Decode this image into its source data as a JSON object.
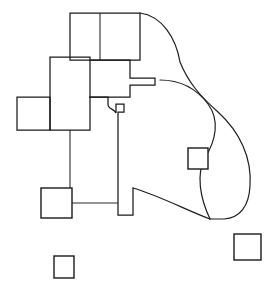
{
  "figure": {
    "width": 277,
    "height": 296,
    "background_color": "#ffffff",
    "stroke_color": "#1a1a1a",
    "stroke_width": 1.25
  },
  "shapes": {
    "top_block": {
      "name": "top-rectangle",
      "outline": "M 70,13 L 140,13 L 140,60 L 70,60 Z",
      "divider": "M 100,13 L 100,60"
    },
    "tall_block": {
      "name": "tall-vertical-rectangle",
      "outline": "M 50,57 L 90,57 L 90,130 L 50,130 Z"
    },
    "left_block": {
      "name": "left-rectangle",
      "outline": "M 17,97 L 50,97 L 50,130 L 17,130 Z"
    },
    "center_body": {
      "name": "stepped-center-polygon",
      "outline": "M 90,60 L 130,60 L 130,78 L 155,78 L 155,85 L 130,85 L 130,97 L 90,97"
    },
    "center_lower": {
      "name": "lower-stepped-polygon",
      "outline": "M 90,97 L 108,97 L 108,104 C 108,110 114,108 116,113 L 116,104 L 124,104 L 124,112 L 118,112 L 118,215 L 133,215 L 133,188"
    },
    "stem_connector": {
      "name": "stem-left-connector",
      "outline": "M 72,203 L 118,203"
    },
    "vertical_connector": {
      "name": "tall-block-to-square-connector",
      "outline": "M 70,130 L 70,188"
    },
    "curve_outer": {
      "name": "outer-sweeping-curve",
      "outline": "M 140,13 C 162,16 176,38 180,62 C 188,82 200,96 218,112 C 240,132 252,158 250,186 C 249,206 240,218 224,219 L 210,219"
    },
    "curve_inner": {
      "name": "inner-sweeping-curve",
      "outline": "M 160,80 C 180,80 196,88 208,104 C 220,120 216,140 205,158 C 196,174 200,198 210,219"
    },
    "curve_bottom": {
      "name": "lower-connector-curve",
      "outline": "M 133,188 C 160,196 186,210 210,219"
    }
  },
  "squares": [
    {
      "name": "square-on-curve",
      "x": 188,
      "y": 148,
      "width": 20,
      "height": 21,
      "label": "curve-intersecting-square"
    },
    {
      "name": "square-lower-left",
      "x": 41,
      "y": 188,
      "width": 31,
      "height": 30,
      "label": "lower-left-square"
    },
    {
      "name": "square-detached-bottom",
      "x": 54,
      "y": 256,
      "width": 20,
      "height": 22,
      "label": "detached-bottom-square"
    },
    {
      "name": "square-detached-right",
      "x": 234,
      "y": 234,
      "width": 27,
      "height": 26,
      "label": "detached-bottom-right-square"
    }
  ]
}
